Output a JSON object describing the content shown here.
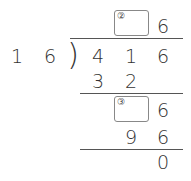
{
  "divisor": [
    "1",
    "6"
  ],
  "dividend": [
    "4",
    "1",
    "6"
  ],
  "quotient": {
    "blank_label": "②",
    "ones": "6"
  },
  "step1": {
    "product": [
      "3",
      "2"
    ]
  },
  "step2": {
    "blank_label": "③",
    "ones": "6",
    "product": [
      "9",
      "6"
    ]
  },
  "remainder": "0",
  "bracket": ")"
}
